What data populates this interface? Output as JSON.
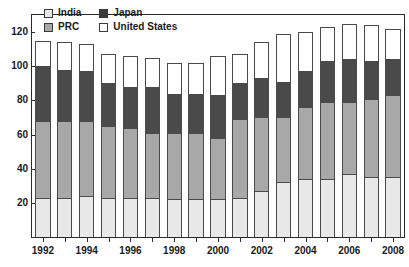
{
  "chart_data": {
    "type": "bar",
    "subtype": "stacked-vertical",
    "title": "",
    "subtitle": "",
    "xlabel": "",
    "ylabel": "",
    "ylim": [
      0,
      130
    ],
    "yticks": [
      20,
      40,
      60,
      80,
      100,
      120
    ],
    "grid": false,
    "legend_position": "top-left-inside",
    "x": [
      1992,
      1993,
      1994,
      1995,
      1996,
      1997,
      1998,
      1999,
      2000,
      2001,
      2002,
      2003,
      2004,
      2005,
      2006,
      2007,
      2008
    ],
    "xtick_labels": [
      "1992",
      "",
      "1994",
      "",
      "1996",
      "",
      "1998",
      "",
      "2000",
      "",
      "2002",
      "",
      "2004",
      "",
      "2006",
      "",
      "2008"
    ],
    "xtick_labels_shown": [
      "1992",
      "1994",
      "1996",
      "1998",
      "2000",
      "2002",
      "2004",
      "2006",
      "2008"
    ],
    "series": [
      {
        "name": "India",
        "color": "#e8e8e8",
        "values": [
          23,
          23,
          24,
          23,
          23,
          23,
          22,
          22,
          22,
          23,
          27,
          32,
          34,
          34,
          37,
          35,
          35
        ]
      },
      {
        "name": "PRC",
        "color": "#a8a8a8",
        "values": [
          45,
          45,
          44,
          42,
          41,
          38,
          39,
          39,
          36,
          46,
          43,
          38,
          42,
          45,
          42,
          46,
          48
        ]
      },
      {
        "name": "Japan",
        "color": "#4a4a4a",
        "values": [
          32,
          30,
          29,
          25,
          24,
          27,
          23,
          23,
          25,
          21,
          23,
          21,
          21,
          24,
          25,
          22,
          21
        ]
      },
      {
        "name": "United States",
        "color": "#ffffff",
        "values": [
          15,
          16,
          16,
          17,
          18,
          17,
          18,
          18,
          23,
          17,
          21,
          28,
          23,
          20,
          21,
          21,
          18
        ]
      }
    ],
    "totals": [
      115,
      114,
      113,
      107,
      106,
      105,
      102,
      102,
      106,
      107,
      114,
      119,
      120,
      123,
      125,
      124,
      122
    ]
  },
  "legend": {
    "items": [
      {
        "label": "India",
        "color": "#e8e8e8"
      },
      {
        "label": "Japan",
        "color": "#3c3c3c"
      },
      {
        "label": "PRC",
        "color": "#a8a8a8"
      },
      {
        "label": "United States",
        "color": "#ffffff"
      }
    ]
  },
  "axes": {
    "y": {
      "ticks": [
        "120",
        "100",
        "80",
        "60",
        "40",
        "20"
      ]
    },
    "x": {
      "ticks": [
        "1992",
        "1994",
        "1996",
        "1998",
        "2000",
        "2002",
        "2004",
        "2006",
        "2008"
      ]
    }
  },
  "colors": {
    "india": "#e8e8e8",
    "prc": "#a8a8a8",
    "japan": "#4a4a4a",
    "united_states": "#ffffff",
    "axis": "#2b2b2b",
    "text": "#1a1a1a"
  }
}
